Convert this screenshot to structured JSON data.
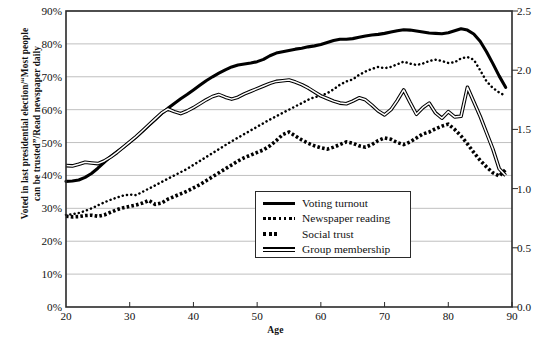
{
  "chart_data": {
    "type": "line",
    "title": "",
    "xlabel": "Age",
    "ylabel": "Voted in last presidential election/“Most people can be trusted”/Read newspaper daily",
    "ylabel_right": "",
    "xlim": [
      20,
      90
    ],
    "ylim": [
      0,
      90
    ],
    "ylim_right": [
      0.0,
      2.5
    ],
    "grid": true,
    "legend_position": "center-bottom-inside",
    "x_ticks": [
      "20",
      "30",
      "40",
      "50",
      "60",
      "70",
      "80",
      "90"
    ],
    "x_tick_values": [
      20,
      30,
      40,
      50,
      60,
      70,
      80,
      90
    ],
    "y_ticks_left": [
      "0%",
      "10%",
      "20%",
      "30%",
      "40%",
      "50%",
      "60%",
      "70%",
      "80%",
      "90%"
    ],
    "y_tick_values_left": [
      0,
      10,
      20,
      30,
      40,
      50,
      60,
      70,
      80,
      90
    ],
    "y_ticks_right": [
      "0.0",
      "0.5",
      "1.0",
      "1.5",
      "2.0",
      "2.5"
    ],
    "y_tick_values_right": [
      0.0,
      0.5,
      1.0,
      1.5,
      2.0,
      2.5
    ],
    "x": [
      20,
      21,
      22,
      23,
      24,
      25,
      26,
      27,
      28,
      29,
      30,
      31,
      32,
      33,
      34,
      35,
      36,
      37,
      38,
      39,
      40,
      41,
      42,
      43,
      44,
      45,
      46,
      47,
      48,
      49,
      50,
      51,
      52,
      53,
      54,
      55,
      56,
      57,
      58,
      59,
      60,
      61,
      62,
      63,
      64,
      65,
      66,
      67,
      68,
      69,
      70,
      71,
      72,
      73,
      74,
      75,
      76,
      77,
      78,
      79,
      80,
      81,
      82,
      83,
      84,
      85,
      86,
      87,
      88,
      89
    ],
    "series": [
      {
        "name": "Voting turnout",
        "style": "solid-thick",
        "axis": "left",
        "values": [
          38.2,
          38.3,
          38.6,
          39.4,
          40.6,
          42.2,
          44.0,
          45.7,
          47.2,
          48.6,
          50.1,
          51.7,
          53.4,
          55.2,
          57.0,
          58.8,
          60.4,
          61.9,
          63.3,
          64.6,
          66.0,
          67.4,
          68.8,
          70.0,
          71.1,
          72.1,
          73.0,
          73.6,
          73.9,
          74.2,
          74.6,
          75.3,
          76.4,
          77.2,
          77.6,
          78.0,
          78.4,
          78.7,
          79.1,
          79.4,
          79.8,
          80.4,
          81.0,
          81.4,
          81.4,
          81.6,
          82.0,
          82.4,
          82.7,
          82.9,
          83.2,
          83.6,
          84.0,
          84.3,
          84.2,
          83.9,
          83.6,
          83.3,
          83.2,
          83.1,
          83.4,
          84.0,
          84.6,
          84.2,
          83.0,
          80.8,
          77.6,
          74.0,
          70.2,
          66.8
        ]
      },
      {
        "name": "Newspaper reading",
        "style": "dotted-fine",
        "axis": "left",
        "values": [
          28.0,
          28.2,
          28.6,
          29.2,
          30.0,
          30.9,
          31.8,
          32.6,
          33.3,
          33.9,
          34.2,
          34.0,
          35.0,
          36.0,
          37.0,
          38.0,
          39.0,
          40.0,
          41.0,
          42.0,
          43.2,
          44.4,
          45.6,
          46.8,
          48.0,
          49.2,
          50.4,
          51.5,
          52.6,
          53.7,
          54.8,
          55.9,
          57.0,
          58.0,
          59.0,
          60.0,
          61.0,
          62.0,
          63.0,
          63.8,
          64.2,
          65.0,
          66.2,
          67.6,
          68.6,
          69.2,
          70.6,
          71.6,
          72.4,
          73.0,
          72.6,
          73.0,
          73.8,
          74.6,
          74.0,
          73.6,
          74.0,
          74.8,
          75.2,
          74.8,
          74.2,
          74.4,
          75.6,
          76.0,
          75.2,
          72.0,
          68.6,
          66.6,
          65.2,
          64.2
        ]
      },
      {
        "name": "Social trust",
        "style": "dotted-thick",
        "axis": "left",
        "values": [
          27.6,
          27.4,
          27.5,
          27.8,
          27.9,
          27.6,
          28.0,
          28.8,
          29.6,
          30.2,
          30.6,
          31.0,
          31.6,
          32.4,
          31.2,
          31.6,
          32.8,
          33.6,
          34.4,
          35.2,
          36.2,
          37.2,
          38.4,
          39.6,
          40.8,
          42.0,
          43.2,
          44.4,
          45.4,
          46.2,
          47.0,
          47.8,
          49.0,
          50.6,
          52.4,
          53.2,
          52.0,
          50.8,
          49.8,
          49.0,
          48.4,
          48.0,
          48.6,
          49.4,
          50.2,
          49.8,
          49.0,
          48.6,
          49.4,
          50.6,
          51.4,
          51.0,
          50.0,
          49.4,
          50.2,
          51.4,
          52.6,
          53.2,
          54.2,
          55.0,
          55.6,
          54.0,
          52.0,
          49.6,
          47.0,
          44.6,
          42.6,
          40.8,
          39.8,
          41.8
        ]
      },
      {
        "name": "Group membership",
        "style": "double-line",
        "axis": "left",
        "values": [
          43.0,
          42.9,
          43.4,
          44.0,
          43.8,
          43.6,
          44.4,
          45.6,
          47.0,
          48.6,
          50.2,
          51.8,
          53.6,
          55.4,
          57.2,
          59.0,
          60.2,
          59.4,
          58.8,
          59.6,
          60.6,
          61.8,
          63.0,
          64.0,
          64.6,
          63.8,
          63.2,
          63.8,
          64.8,
          65.6,
          66.4,
          67.2,
          68.0,
          68.6,
          68.8,
          69.0,
          68.4,
          67.6,
          66.6,
          65.4,
          64.2,
          63.4,
          62.6,
          62.0,
          61.8,
          62.6,
          63.6,
          63.0,
          61.4,
          59.6,
          58.4,
          60.0,
          62.8,
          66.0,
          62.2,
          58.6,
          60.6,
          62.0,
          59.0,
          57.4,
          59.4,
          57.8,
          58.0,
          66.8,
          62.4,
          58.0,
          53.0,
          48.0,
          42.0,
          40.0
        ]
      }
    ]
  },
  "legend": {
    "items": [
      {
        "label": "Voting turnout",
        "style": "solid-thick"
      },
      {
        "label": "Newspaper reading",
        "style": "dotted-fine"
      },
      {
        "label": "Social trust",
        "style": "dotted-thick"
      },
      {
        "label": "Group membership",
        "style": "double-line"
      }
    ]
  },
  "axis_title": {
    "left_line1": "Voted in last presidential election/“Most people",
    "left_line2": "can be trusted”/Read newspaper daily",
    "bottom": "Age"
  },
  "colors": {
    "line": "#000000",
    "grid": "#b9b9b9",
    "axis": "#2a2a2a",
    "text": "#111111",
    "background": "#ffffff"
  }
}
